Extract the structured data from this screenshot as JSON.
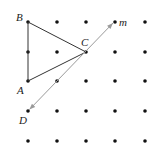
{
  "diagram": {
    "grid": {
      "columns_x": [
        28,
        57,
        86,
        115,
        145
      ],
      "rows_y": [
        22,
        52,
        81,
        111,
        141
      ],
      "dot_color": "#111111",
      "dot_radius": 1.8
    },
    "points": {
      "B": {
        "label": "B",
        "x": 28,
        "y": 22,
        "label_x": 16,
        "label_y": 21
      },
      "C": {
        "label": "C",
        "x": 86,
        "y": 52,
        "label_x": 81,
        "label_y": 46
      },
      "A": {
        "label": "A",
        "x": 28,
        "y": 81,
        "label_x": 17,
        "label_y": 94
      },
      "D": {
        "label": "D",
        "x": 28,
        "y": 111,
        "label_x": 19,
        "label_y": 124
      }
    },
    "line_m": {
      "label": "m",
      "label_x": 119,
      "label_y": 26,
      "color": "#9a9a9a"
    },
    "triangle": {
      "vertices": [
        "A",
        "B",
        "C"
      ],
      "color": "#333333"
    }
  }
}
